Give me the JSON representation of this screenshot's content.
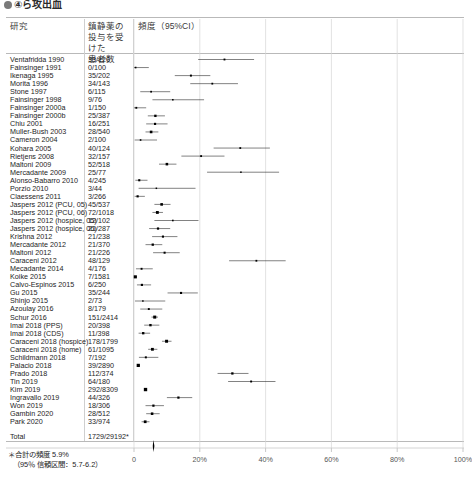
{
  "banner": {
    "title": "④ら攻出血",
    "bullet_icon": "filled-circle-icon"
  },
  "headers": {
    "study": "研究",
    "count": "鎮静薬の\n投与を受けた\n患者数",
    "rate": "頻度（95%CI）"
  },
  "footer": {
    "line1": "＊合計の頻度 5.9%",
    "line2": "（95％ 信頼区間：5.7-6.2）"
  },
  "total": {
    "label": "Total",
    "count": "1729/29192*"
  },
  "axis": {
    "ticks": [
      "0",
      "20%",
      "40%",
      "60%",
      "80%",
      "100%"
    ],
    "tick_values": [
      0,
      20,
      40,
      60,
      80,
      100
    ],
    "x0_px": 134,
    "x100_px": 463
  },
  "chart_data": {
    "type": "forest",
    "title": "",
    "xlabel": "",
    "ylabel": "",
    "xlim": [
      0,
      100
    ],
    "grid": true,
    "legend": "none",
    "x_ticks": [
      0,
      20,
      40,
      60,
      80,
      100
    ],
    "x_tick_labels": [
      "0",
      "20%",
      "40%",
      "60%",
      "80%",
      "100%"
    ],
    "summary": {
      "estimate": 5.9,
      "ci_low": 5.7,
      "ci_high": 6.2,
      "label": "Total",
      "count": "1729/29192*"
    },
    "rows": [
      {
        "study": "Ventafridda 1990",
        "count": "33/120",
        "est": 27.5,
        "lo": 19.5,
        "hi": 36.5,
        "w": 3.0
      },
      {
        "study": "Fainsinger 1991",
        "count": "0/100",
        "est": 0.5,
        "lo": 0.0,
        "hi": 4.5,
        "w": 2.6
      },
      {
        "study": "Ikenaga 1995",
        "count": "35/202",
        "est": 17.3,
        "lo": 12.4,
        "hi": 23.2,
        "w": 3.2
      },
      {
        "study": "Morita 1996",
        "count": "34/143",
        "est": 23.8,
        "lo": 17.1,
        "hi": 31.6,
        "w": 2.9
      },
      {
        "study": "Stone 1997",
        "count": "6/115",
        "est": 5.2,
        "lo": 1.9,
        "hi": 11.0,
        "w": 2.8
      },
      {
        "study": "Fainsinger 1998",
        "count": "9/76",
        "est": 11.8,
        "lo": 5.6,
        "hi": 21.3,
        "w": 2.5
      },
      {
        "study": "Fainsinger 2000a",
        "count": "1/150",
        "est": 0.7,
        "lo": 0.0,
        "hi": 3.7,
        "w": 3.0
      },
      {
        "study": "Fainsinger 2000b",
        "count": "25/387",
        "est": 6.5,
        "lo": 4.2,
        "hi": 9.4,
        "w": 3.8
      },
      {
        "study": "Chiu 2001",
        "count": "16/251",
        "est": 6.4,
        "lo": 3.7,
        "hi": 10.2,
        "w": 3.5
      },
      {
        "study": "Muller-Bush 2003",
        "count": "28/540",
        "est": 5.2,
        "lo": 3.5,
        "hi": 7.4,
        "w": 4.2
      },
      {
        "study": "Cameron 2004",
        "count": "2/100",
        "est": 2.0,
        "lo": 0.2,
        "hi": 7.0,
        "w": 2.6
      },
      {
        "study": "Kohara 2005",
        "count": "40/124",
        "est": 32.3,
        "lo": 24.2,
        "hi": 41.3,
        "w": 2.9
      },
      {
        "study": "Rietjens 2008",
        "count": "32/157",
        "est": 20.4,
        "lo": 14.4,
        "hi": 27.5,
        "w": 3.0
      },
      {
        "study": "Maltoni 2009",
        "count": "52/518",
        "est": 10.0,
        "lo": 7.6,
        "hi": 12.9,
        "w": 4.1
      },
      {
        "study": "Mercadante 2009",
        "count": "25/77",
        "est": 32.5,
        "lo": 22.2,
        "hi": 44.1,
        "w": 2.4
      },
      {
        "study": "Alonso-Babarro 2010",
        "count": "4/245",
        "est": 1.6,
        "lo": 0.4,
        "hi": 4.1,
        "w": 3.4
      },
      {
        "study": "Porzio 2010",
        "count": "3/44",
        "est": 6.8,
        "lo": 1.4,
        "hi": 18.7,
        "w": 2.0
      },
      {
        "study": "Claessens 2011",
        "count": "3/266",
        "est": 1.1,
        "lo": 0.2,
        "hi": 3.3,
        "w": 3.5
      },
      {
        "study": "Jaspers 2012 (PCU, 05)",
        "count": "45/537",
        "est": 8.4,
        "lo": 6.2,
        "hi": 11.1,
        "w": 4.2
      },
      {
        "study": "Jaspers 2012 (PCU, 06)",
        "count": "72/1018",
        "est": 7.1,
        "lo": 5.6,
        "hi": 8.8,
        "w": 4.6
      },
      {
        "study": "Jaspers 2012 (hospice, 05)",
        "count": "12/102",
        "est": 11.8,
        "lo": 6.2,
        "hi": 19.6,
        "w": 2.6
      },
      {
        "study": "Jaspers 2012 (hospice, 06)",
        "count": "21/287",
        "est": 7.3,
        "lo": 4.6,
        "hi": 11.0,
        "w": 3.6
      },
      {
        "study": "Krishna 2012",
        "count": "21/238",
        "est": 8.8,
        "lo": 5.5,
        "hi": 13.2,
        "w": 3.4
      },
      {
        "study": "Mercadante 2012",
        "count": "21/370",
        "est": 5.7,
        "lo": 3.5,
        "hi": 8.6,
        "w": 3.7
      },
      {
        "study": "Maltoni 2012",
        "count": "21/226",
        "est": 9.3,
        "lo": 5.8,
        "hi": 13.9,
        "w": 3.3
      },
      {
        "study": "Caraceni 2012",
        "count": "48/129",
        "est": 37.2,
        "lo": 28.9,
        "hi": 46.1,
        "w": 2.9
      },
      {
        "study": "Mecadante 2014",
        "count": "4/176",
        "est": 2.3,
        "lo": 0.6,
        "hi": 5.7,
        "w": 3.1
      },
      {
        "study": "Koike 2015",
        "count": "7/1581",
        "est": 0.4,
        "lo": 0.2,
        "hi": 0.9,
        "w": 5.0
      },
      {
        "study": "Calvo-Espinos 2015",
        "count": "6/250",
        "est": 2.4,
        "lo": 0.9,
        "hi": 5.2,
        "w": 3.5
      },
      {
        "study": "Gu 2015",
        "count": "35/244",
        "est": 14.3,
        "lo": 10.2,
        "hi": 19.4,
        "w": 3.4
      },
      {
        "study": "Shinjo 2015",
        "count": "2/73",
        "est": 2.7,
        "lo": 0.3,
        "hi": 9.5,
        "w": 2.4
      },
      {
        "study": "Azoulay 2016",
        "count": "8/179",
        "est": 4.5,
        "lo": 1.9,
        "hi": 8.6,
        "w": 3.1
      },
      {
        "study": "Schur 2016",
        "count": "151/2414",
        "est": 6.3,
        "lo": 5.3,
        "hi": 7.3,
        "w": 4.9
      },
      {
        "study": "Imai 2018 (PPS)",
        "count": "20/398",
        "est": 5.0,
        "lo": 3.1,
        "hi": 7.7,
        "w": 3.8
      },
      {
        "study": "Imai 2018 (CDS)",
        "count": "11/398",
        "est": 2.8,
        "lo": 1.4,
        "hi": 4.9,
        "w": 3.8
      },
      {
        "study": "Caraceni 2018 (hospice)",
        "count": "178/1799",
        "est": 9.9,
        "lo": 8.5,
        "hi": 11.4,
        "w": 4.8
      },
      {
        "study": "Caraceni 2018 (home)",
        "count": "61/1095",
        "est": 5.6,
        "lo": 4.3,
        "hi": 7.1,
        "w": 4.5
      },
      {
        "study": "Schildmann 2018",
        "count": "7/192",
        "est": 3.6,
        "lo": 1.5,
        "hi": 7.4,
        "w": 3.2
      },
      {
        "study": "Palacio 2018",
        "count": "39/2890",
        "est": 1.3,
        "lo": 1.0,
        "hi": 1.8,
        "w": 5.2
      },
      {
        "study": "Prado 2018",
        "count": "112/374",
        "est": 29.9,
        "lo": 25.4,
        "hi": 34.8,
        "w": 3.7
      },
      {
        "study": "Tin 2019",
        "count": "64/180",
        "est": 35.6,
        "lo": 28.6,
        "hi": 43.0,
        "w": 3.1
      },
      {
        "study": "Kim 2019",
        "count": "292/8309",
        "est": 3.5,
        "lo": 3.1,
        "hi": 3.9,
        "w": 5.4
      },
      {
        "study": "Ingravallo 2019",
        "count": "44/326",
        "est": 13.5,
        "lo": 10.0,
        "hi": 17.7,
        "w": 3.6
      },
      {
        "study": "Won 2019",
        "count": "18/306",
        "est": 5.9,
        "lo": 3.5,
        "hi": 9.1,
        "w": 3.6
      },
      {
        "study": "Gambin 2020",
        "count": "28/512",
        "est": 5.5,
        "lo": 3.7,
        "hi": 7.8,
        "w": 4.1
      },
      {
        "study": "Park 2020",
        "count": "33/974",
        "est": 3.4,
        "lo": 2.3,
        "hi": 4.7,
        "w": 4.4
      }
    ]
  }
}
